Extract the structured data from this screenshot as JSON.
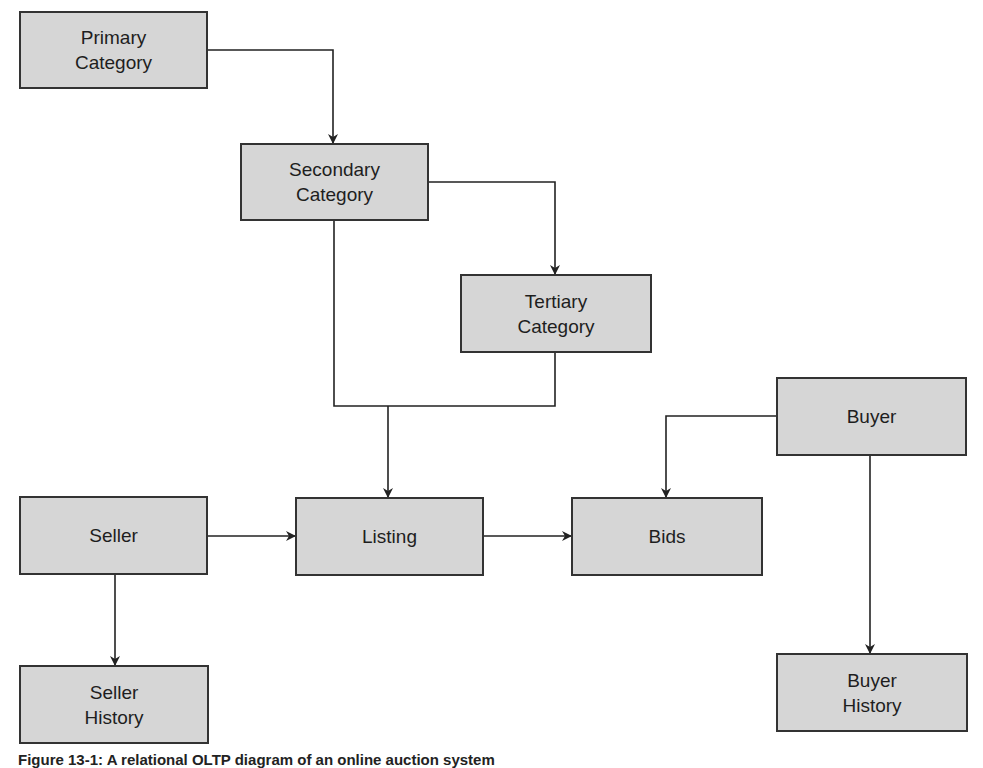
{
  "diagram": {
    "nodes": {
      "primary_category": "Primary\nCategory",
      "secondary_category": "Secondary\nCategory",
      "tertiary_category": "Tertiary\nCategory",
      "seller": "Seller",
      "listing": "Listing",
      "bids": "Bids",
      "buyer": "Buyer",
      "seller_history": "Seller\nHistory",
      "buyer_history": "Buyer\nHistory"
    },
    "edges": [
      {
        "from": "Primary Category",
        "to": "Secondary Category"
      },
      {
        "from": "Secondary Category",
        "to": "Tertiary Category"
      },
      {
        "from": "Secondary Category",
        "to": "Listing"
      },
      {
        "from": "Tertiary Category",
        "to": "Listing"
      },
      {
        "from": "Seller",
        "to": "Listing"
      },
      {
        "from": "Seller",
        "to": "Seller History"
      },
      {
        "from": "Listing",
        "to": "Bids"
      },
      {
        "from": "Buyer",
        "to": "Bids"
      },
      {
        "from": "Buyer",
        "to": "Buyer History"
      }
    ],
    "caption": "Figure 13-1: A relational OLTP diagram of an online auction system"
  },
  "colors": {
    "box_fill": "#d6d6d6",
    "box_border": "#333333",
    "line": "#222222"
  }
}
